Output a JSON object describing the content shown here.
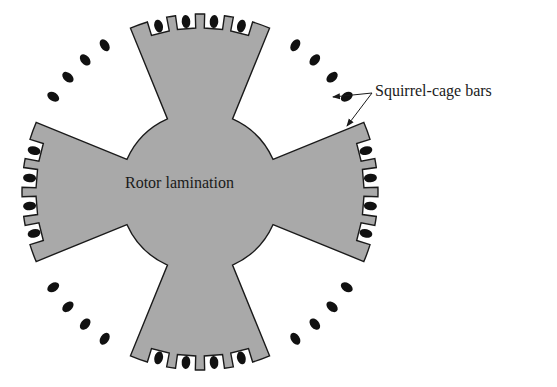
{
  "diagram": {
    "labels": {
      "rotor": "Rotor lamination",
      "bars": "Squirrel-cage bars"
    },
    "colors": {
      "lamination_fill": "#a9a9a9",
      "outline": "#1a1a1a",
      "bar_fill": "#111111",
      "background": "#ffffff"
    },
    "geometry": {
      "center": [
        200,
        192
      ],
      "hub_radius": 80,
      "outer_radius": 178,
      "poles": 4,
      "slots_per_pole": 4,
      "free_bars_between_poles": 4
    }
  }
}
